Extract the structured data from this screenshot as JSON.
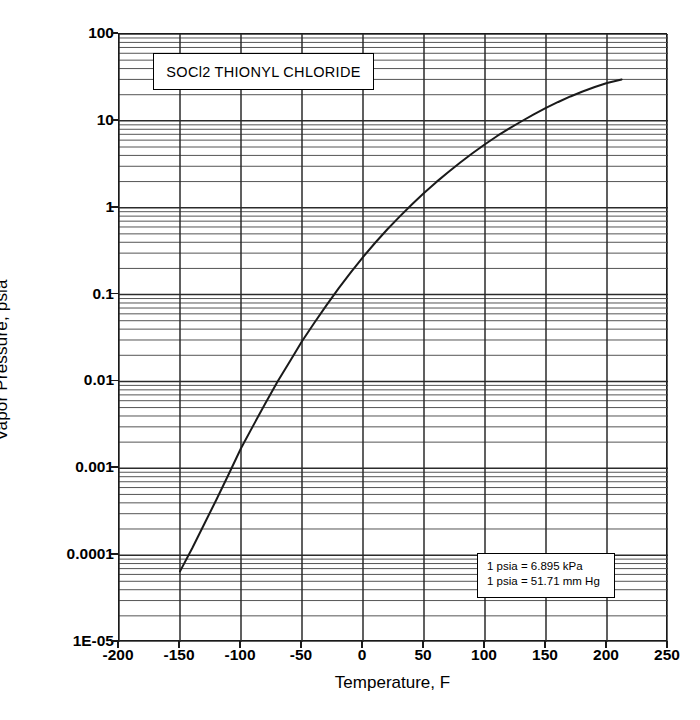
{
  "chart_data": {
    "type": "line",
    "title": "SOCl2  THIONYL CHLORIDE",
    "xlabel": "Temperature, F",
    "ylabel": "Vapor Pressure, psia",
    "yscale": "log",
    "xscale": "linear",
    "xlim": [
      -200,
      250
    ],
    "ylim": [
      1e-05,
      100
    ],
    "grid": "major and minor log gridlines on y, major vertical gridlines on x",
    "legend": "none",
    "xticks": [
      -200,
      -150,
      -100,
      -50,
      0,
      50,
      100,
      150,
      200,
      250
    ],
    "xtick_labels": [
      "-200",
      "-150",
      "-100",
      "-50",
      "0",
      "50",
      "100",
      "150",
      "200",
      "250"
    ],
    "yticks": [
      1e-05,
      0.0001,
      0.001,
      0.01,
      0.1,
      1,
      10,
      100
    ],
    "ytick_labels": [
      "1E-05",
      "0.0001",
      "0.001",
      "0.01",
      "0.1",
      "1",
      "10",
      "100"
    ],
    "series": [
      {
        "name": "SOCl2 vapor pressure",
        "x": [
          -150,
          -140,
          -130,
          -120,
          -110,
          -100,
          -90,
          -80,
          -70,
          -60,
          -50,
          -40,
          -30,
          -20,
          -10,
          0,
          10,
          20,
          30,
          40,
          50,
          60,
          70,
          80,
          90,
          100,
          110,
          120,
          130,
          140,
          150,
          160,
          170,
          180,
          190,
          200,
          212
        ],
        "y": [
          6.5e-05,
          0.00012,
          0.00023,
          0.00044,
          0.00086,
          0.0017,
          0.0031,
          0.0056,
          0.01,
          0.017,
          0.029,
          0.047,
          0.075,
          0.118,
          0.18,
          0.27,
          0.395,
          0.565,
          0.79,
          1.09,
          1.48,
          1.97,
          2.58,
          3.34,
          4.27,
          5.38,
          6.7,
          8.2,
          9.9,
          11.9,
          14.1,
          16.5,
          19.1,
          21.8,
          24.5,
          27.3,
          30.0
        ]
      }
    ],
    "annotations": [
      "1 psia = 6.895 kPa",
      "1 psia = 51.71 mm Hg"
    ]
  },
  "notes": {
    "line1": "1 psia = 6.895 kPa",
    "line2": "1 psia = 51.71 mm Hg"
  },
  "colors": {
    "curve": "#1a1a1a",
    "grid_major": "#2b2b2b",
    "grid_minor": "#555555",
    "frame": "#1a1a1a",
    "background": "#ffffff"
  }
}
